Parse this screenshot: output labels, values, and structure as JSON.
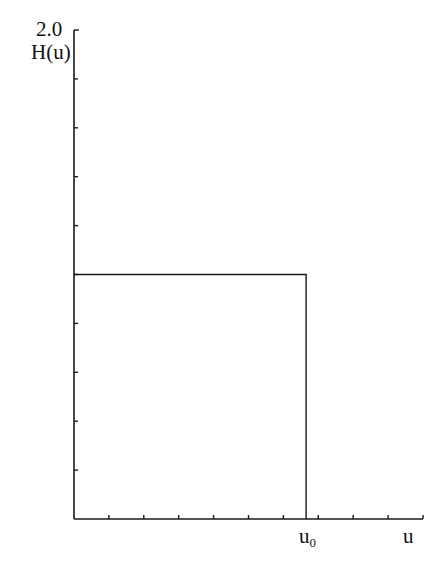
{
  "chart_data": {
    "type": "line",
    "title": "",
    "xlabel": "u",
    "ylabel": "H(u)",
    "ylim": [
      0,
      2.0
    ],
    "xlim": [
      0,
      10
    ],
    "y_top_tick_label": "2.0",
    "y_ticks": [
      0,
      0.2,
      0.4,
      0.6,
      0.8,
      1.0,
      1.2,
      1.4,
      1.6,
      1.8,
      2.0
    ],
    "x_ticks_count": 10,
    "x_annotations": [
      {
        "label_base": "u",
        "label_sub": "0",
        "x": 6.65
      }
    ],
    "grid": false,
    "legend": null,
    "series": [
      {
        "name": "H(u) ideal lowpass",
        "points": [
          {
            "x": 0,
            "y": 1.0
          },
          {
            "x": 6.65,
            "y": 1.0
          },
          {
            "x": 6.65,
            "y": 0
          }
        ]
      }
    ]
  },
  "labels": {
    "y_top": "2.0",
    "y_axis": "H(u)",
    "cutoff_base": "u",
    "cutoff_sub": "0",
    "x_axis": "u"
  },
  "colors": {
    "axis": "#1a1a1a",
    "curve": "#1a1a1a",
    "background": "#ffffff"
  }
}
